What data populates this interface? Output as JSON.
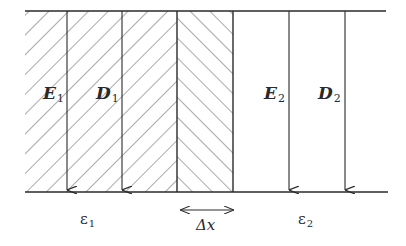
{
  "diagram": {
    "regions": [
      {
        "name": "medium-1",
        "hatch": "backslash",
        "permittivity_label": {
          "symbol": "ε",
          "sub": "1"
        }
      },
      {
        "name": "delta-x-strip",
        "hatch": "slash",
        "width_label": "Δx"
      },
      {
        "name": "medium-2",
        "hatch": "none",
        "permittivity_label": {
          "symbol": "ε",
          "sub": "2"
        }
      }
    ],
    "vectors": [
      {
        "symbol": "E",
        "sub": "1",
        "region": "medium-1",
        "direction": "down"
      },
      {
        "symbol": "D",
        "sub": "1",
        "region": "medium-1",
        "direction": "down"
      },
      {
        "symbol": "E",
        "sub": "2",
        "region": "medium-2",
        "direction": "down"
      },
      {
        "symbol": "D",
        "sub": "2",
        "region": "medium-2",
        "direction": "down"
      }
    ],
    "dimension": {
      "label": "Δx",
      "type": "double-arrow"
    },
    "colors": {
      "line": "#2a2a2a",
      "hatch": "#555555",
      "background": "#ffffff"
    }
  }
}
